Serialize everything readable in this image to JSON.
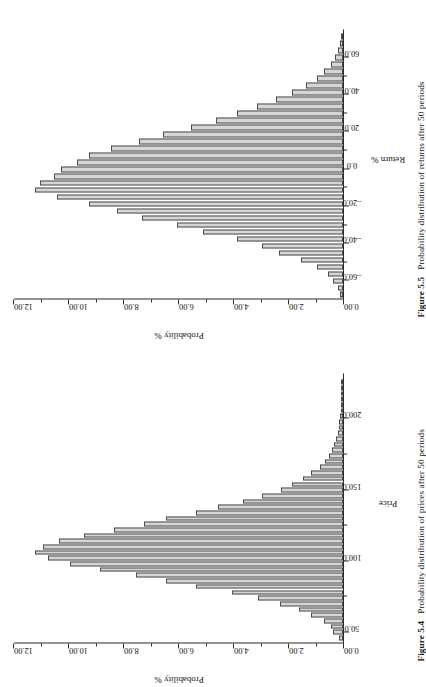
{
  "page": {
    "background": "#ffffff",
    "bar_fill": "#d6d6d6",
    "bar_stroke": "#4a4a4a",
    "axis_color": "#2b2b2b"
  },
  "figures": [
    {
      "id": "fig55",
      "caption_number": "Figure 5.5",
      "caption_text": "Probability distribution of returns after 50 periods",
      "chart_data": {
        "type": "bar",
        "title": "",
        "xlabel": "Return %",
        "ylabel": "Probability %",
        "xlim": [
          -70.0,
          75.0
        ],
        "ylim": [
          0.0,
          12.0
        ],
        "xticks": [
          -60.0,
          -40.0,
          -20.0,
          0.0,
          20.0,
          40.0,
          60.0
        ],
        "xticklabels": [
          "–60.0",
          "–40.0",
          "–20.0",
          "0.0",
          "20.0",
          "40.0",
          "60.0"
        ],
        "yticks": [
          0.0,
          2.0,
          4.0,
          6.0,
          8.0,
          10.0,
          12.0
        ],
        "yticklabels": [
          "0.00",
          "2.00",
          "4.00",
          "6.00",
          "8.00",
          "10.00",
          "12.00"
        ],
        "grid": false,
        "legend": "none",
        "x": [
          -67.5,
          -63.75,
          -60.0,
          -56.25,
          -52.5,
          -48.75,
          -45.0,
          -41.25,
          -37.5,
          -33.75,
          -30.0,
          -26.25,
          -22.5,
          -18.75,
          -15.0,
          -11.25,
          -7.5,
          -3.75,
          0.0,
          3.75,
          7.5,
          11.25,
          15.0,
          18.75,
          22.5,
          26.25,
          30.0,
          33.75,
          37.5,
          41.25,
          45.0,
          48.75,
          52.5,
          56.25,
          60.0,
          63.75,
          67.5,
          71.25
        ],
        "values": [
          0.12,
          0.18,
          0.35,
          0.55,
          0.95,
          1.55,
          2.35,
          2.95,
          3.85,
          5.1,
          6.05,
          7.35,
          8.25,
          9.25,
          10.45,
          11.25,
          11.05,
          10.55,
          10.3,
          9.7,
          9.25,
          8.45,
          7.45,
          6.55,
          5.55,
          4.65,
          3.85,
          3.15,
          2.45,
          1.85,
          1.35,
          0.95,
          0.7,
          0.45,
          0.3,
          0.2,
          0.12,
          0.08
        ]
      }
    },
    {
      "id": "fig54",
      "caption_number": "Figure 5.4",
      "caption_text": "Probability distribution of prices after 50 periods",
      "chart_data": {
        "type": "bar",
        "title": "",
        "xlabel": "Price",
        "ylabel": "Probability %",
        "xlim": [
          42.0,
          232.0
        ],
        "ylim": [
          0.0,
          12.0
        ],
        "xticks": [
          50.0,
          100.0,
          150.0,
          200.0
        ],
        "xticklabels": [
          "50.0",
          "100.0",
          "150.0",
          "200.0"
        ],
        "yticks": [
          0.0,
          2.0,
          4.0,
          6.0,
          8.0,
          10.0,
          12.0
        ],
        "yticklabels": [
          "0.00",
          "2.00",
          "4.00",
          "6.00",
          "8.00",
          "10.00",
          "12.00"
        ],
        "grid": false,
        "legend": "none",
        "x": [
          46.0,
          50.0,
          54.0,
          58.0,
          62.0,
          66.0,
          70.0,
          74.0,
          78.0,
          82.0,
          86.0,
          90.0,
          94.0,
          98.0,
          102.0,
          106.0,
          110.0,
          114.0,
          118.0,
          122.0,
          126.0,
          130.0,
          134.0,
          138.0,
          142.0,
          146.0,
          150.0,
          154.0,
          158.0,
          162.0,
          166.0,
          170.0,
          174.0,
          178.0,
          182.0,
          186.0,
          190.0,
          194.0,
          198.0,
          202.0,
          206.0,
          210.0,
          214.0,
          218.0,
          222.0,
          226.0
        ],
        "values": [
          0.15,
          0.35,
          0.45,
          0.7,
          1.15,
          1.6,
          2.3,
          3.1,
          4.05,
          5.35,
          6.45,
          7.55,
          8.85,
          9.95,
          10.75,
          11.25,
          10.95,
          10.35,
          9.45,
          8.35,
          7.25,
          6.45,
          5.35,
          4.55,
          3.65,
          2.95,
          2.25,
          1.85,
          1.45,
          1.15,
          0.85,
          0.65,
          0.5,
          0.4,
          0.32,
          0.26,
          0.2,
          0.16,
          0.13,
          0.11,
          0.09,
          0.07,
          0.06,
          0.05,
          0.04,
          0.03
        ]
      }
    }
  ]
}
